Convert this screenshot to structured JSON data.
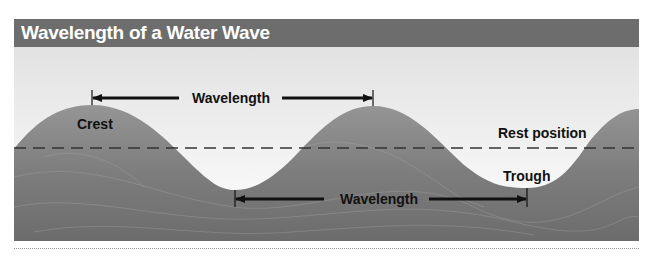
{
  "figure": {
    "title": "Wavelength of a Water Wave",
    "labels": {
      "wavelength_top": "Wavelength",
      "wavelength_bottom": "Wavelength",
      "crest": "Crest",
      "trough": "Trough",
      "rest_position": "Rest position"
    },
    "colors": {
      "title_bar": "#6d6d6d",
      "title_text": "#ffffff",
      "sky_top": "#e4e4e4",
      "sky_bottom": "#ffffff",
      "water_light": "#8f8f8f",
      "water_dark": "#6a6a6a",
      "annotation": "#111111",
      "footer_rule": "#9a9a9a"
    }
  }
}
